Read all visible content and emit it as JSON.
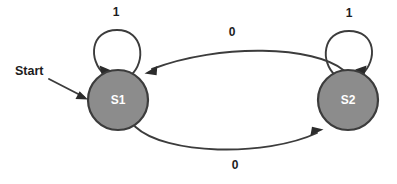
{
  "diagram": {
    "type": "state-transition-diagram",
    "background_color": "#ffffff",
    "node_fill_color": "#8c8c8c",
    "node_stroke_color": "#3c3c3c",
    "node_text_color": "#ffffff",
    "edge_color": "#3c3c3c",
    "label_text_color": "#1d1d1d",
    "start": {
      "label": "Start"
    },
    "states": [
      {
        "id": "S1",
        "label": "S1",
        "cx": 118,
        "cy": 100,
        "r": 30
      },
      {
        "id": "S2",
        "label": "S2",
        "cx": 348,
        "cy": 100,
        "r": 30
      }
    ],
    "transitions": [
      {
        "id": "s1-self",
        "from": "S1",
        "to": "S1",
        "label": "1",
        "kind": "self-loop",
        "label_x": 116,
        "label_y": 13
      },
      {
        "id": "s2-self",
        "from": "S2",
        "to": "S2",
        "label": "1",
        "kind": "self-loop",
        "label_x": 349,
        "label_y": 14
      },
      {
        "id": "s2-to-s1",
        "from": "S2",
        "to": "S1",
        "label": "0",
        "kind": "curve-top",
        "label_x": 232,
        "label_y": 33
      },
      {
        "id": "s1-to-s2",
        "from": "S1",
        "to": "S2",
        "label": "0",
        "kind": "curve-bottom",
        "label_x": 235,
        "label_y": 166
      }
    ]
  }
}
